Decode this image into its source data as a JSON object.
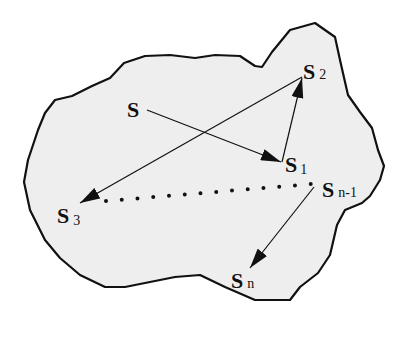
{
  "diagram": {
    "type": "state-space-trajectory",
    "region": {
      "fill": "#eeeeee",
      "stroke": "#111111"
    },
    "nodes": [
      {
        "id": "S",
        "main": "S",
        "sub": ""
      },
      {
        "id": "S1",
        "main": "S",
        "sub": "1"
      },
      {
        "id": "S2",
        "main": "S",
        "sub": "2"
      },
      {
        "id": "S3",
        "main": "S",
        "sub": "3"
      },
      {
        "id": "Sn-1",
        "main": "S",
        "sub": "n-1"
      },
      {
        "id": "Sn",
        "main": "S",
        "sub": "n"
      }
    ],
    "edges": [
      {
        "from": "S",
        "to": "S1",
        "style": "arrow"
      },
      {
        "from": "S1",
        "to": "S2",
        "style": "arrow"
      },
      {
        "from": "S2",
        "to": "S3",
        "style": "arrow"
      },
      {
        "from": "S3",
        "to": "Sn-1",
        "style": "dotted"
      },
      {
        "from": "Sn-1",
        "to": "Sn",
        "style": "arrow"
      }
    ]
  }
}
